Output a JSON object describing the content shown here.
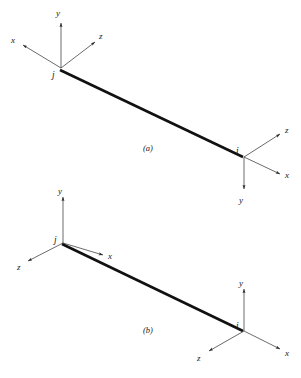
{
  "figure": {
    "width": 301,
    "height": 378,
    "background_color": "#ffffff",
    "line_color": "#111111",
    "axis_color": "#2b2b2b"
  },
  "panels": [
    {
      "id": "a",
      "caption": "(a)",
      "caption_pos": {
        "x": 148,
        "y": 150
      },
      "beam": {
        "x1": 60,
        "y1": 70,
        "x2": 243,
        "y2": 157
      },
      "nodes": [
        {
          "name": "j",
          "label": "j",
          "label_pos": {
            "x": 54,
            "y": 76
          },
          "origin": {
            "x": 61,
            "y": 68
          },
          "axes": [
            {
              "axis": "y",
              "label": "y",
              "tip": {
                "x": 61,
                "y": 22
              },
              "label_pos": {
                "x": 56,
                "y": 15
              }
            },
            {
              "axis": "x",
              "label": "x",
              "tip": {
                "x": 22,
                "y": 45
              },
              "label_pos": {
                "x": 11,
                "y": 42
              }
            },
            {
              "axis": "z",
              "label": "z",
              "tip": {
                "x": 96,
                "y": 41
              },
              "label_pos": {
                "x": 99,
                "y": 38
              }
            }
          ]
        },
        {
          "name": "i",
          "label": "i",
          "label_pos": {
            "x": 238,
            "y": 152
          },
          "origin": {
            "x": 244,
            "y": 157
          },
          "axes": [
            {
              "axis": "z",
              "label": "z",
              "tip": {
                "x": 281,
                "y": 133
              },
              "label_pos": {
                "x": 285,
                "y": 131
              }
            },
            {
              "axis": "x",
              "label": "x",
              "tip": {
                "x": 281,
                "y": 175
              },
              "label_pos": {
                "x": 285,
                "y": 176
              }
            },
            {
              "axis": "y",
              "label": "y",
              "tip": {
                "x": 244,
                "y": 190
              },
              "label_pos": {
                "x": 239,
                "y": 201
              }
            }
          ]
        }
      ]
    },
    {
      "id": "b",
      "caption": "(b)",
      "caption_pos": {
        "x": 148,
        "y": 332
      },
      "beam": {
        "x1": 62,
        "y1": 244,
        "x2": 243,
        "y2": 331
      },
      "nodes": [
        {
          "name": "j",
          "label": "j",
          "label_pos": {
            "x": 56,
            "y": 241
          },
          "origin": {
            "x": 63,
            "y": 243
          },
          "axes": [
            {
              "axis": "y",
              "label": "y",
              "tip": {
                "x": 63,
                "y": 196
              },
              "label_pos": {
                "x": 58,
                "y": 192
              }
            },
            {
              "axis": "z",
              "label": "z",
              "tip": {
                "x": 27,
                "y": 262
              },
              "label_pos": {
                "x": 18,
                "y": 268
              }
            },
            {
              "axis": "x",
              "label": "x",
              "tip": {
                "x": 104,
                "y": 256
              },
              "label_pos": {
                "x": 108,
                "y": 257
              }
            }
          ]
        },
        {
          "name": "i",
          "label": "i",
          "label_pos": {
            "x": 238,
            "y": 327
          },
          "origin": {
            "x": 244,
            "y": 331
          },
          "axes": [
            {
              "axis": "y",
              "label": "y",
              "tip": {
                "x": 244,
                "y": 288
              },
              "label_pos": {
                "x": 239,
                "y": 284
              }
            },
            {
              "axis": "z",
              "label": "z",
              "tip": {
                "x": 208,
                "y": 352
              },
              "label_pos": {
                "x": 199,
                "y": 359
              }
            },
            {
              "axis": "x",
              "label": "x",
              "tip": {
                "x": 281,
                "y": 350
              },
              "label_pos": {
                "x": 285,
                "y": 353
              }
            }
          ]
        }
      ]
    }
  ]
}
